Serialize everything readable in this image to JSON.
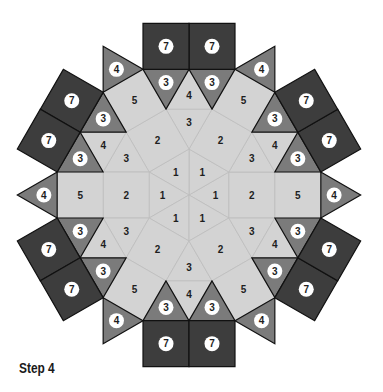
{
  "step_label": "Step 4",
  "geometry": {
    "center": [
      189,
      195
    ],
    "edge": 46,
    "symmetry": 6
  },
  "colors": {
    "light": "#d3d3d3",
    "light_line": "#bdbdbd",
    "mid": "#7b7b7b",
    "dark": "#3d3d3d",
    "outline": "#111111",
    "label_dark": "#1e1e1e",
    "circle_fill": "#ffffff"
  },
  "pieces": {
    "hex_triangle": {
      "label": "1",
      "tone": "light",
      "circled": false
    },
    "inner_square": {
      "label": "2",
      "tone": "light",
      "circled": false
    },
    "inner_triangle": {
      "label": "3",
      "tone": "light",
      "circled": false
    },
    "outer_light_triangle": {
      "label": "4",
      "tone": "light",
      "circled": false
    },
    "outer_square": {
      "label": "5",
      "tone": "light",
      "circled": false
    },
    "dark_triangle": {
      "label": "3",
      "tone": "mid",
      "circled": true
    },
    "tip_triangle": {
      "label": "4",
      "tone": "mid",
      "circled": true
    },
    "corner_square": {
      "label": "7",
      "tone": "dark",
      "circled": true
    }
  }
}
